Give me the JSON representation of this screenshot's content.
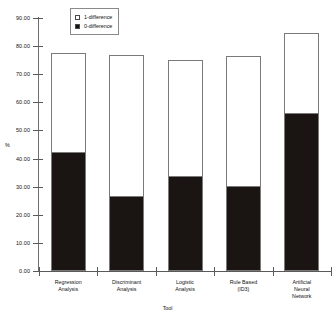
{
  "chart_data": {
    "type": "bar",
    "subtype": "stacked",
    "title": "",
    "xlabel": "Tool",
    "ylabel": "%",
    "categories": [
      "Regression\nAnalysis",
      "Discriminant\nAnalysis",
      "Logistic\nAnalysis",
      "Rule Based\n(ID3)",
      "Artificial\nNeural\nNetwork"
    ],
    "series": [
      {
        "name": "0-difference",
        "color": "#1a1412",
        "values": [
          42.0,
          26.5,
          33.5,
          30.0,
          56.0
        ]
      },
      {
        "name": "1-difference",
        "color": "#ffffff",
        "values": [
          35.5,
          50.5,
          41.5,
          46.5,
          28.5
        ]
      }
    ],
    "totals": [
      77.5,
      77.0,
      75.0,
      76.5,
      84.5
    ],
    "ylim": [
      0.0,
      90.0
    ],
    "ytick_step": 10.0,
    "ytick_labels": [
      "0.00",
      "10.00",
      "20.00",
      "30.00",
      "40.00",
      "50.00",
      "60.00",
      "70.00",
      "80.00",
      "90.00"
    ],
    "grid": false,
    "legend_position": "top-center",
    "legend": [
      {
        "label": "1-difference",
        "swatch": "white"
      },
      {
        "label": "0-difference",
        "swatch": "black"
      }
    ]
  }
}
